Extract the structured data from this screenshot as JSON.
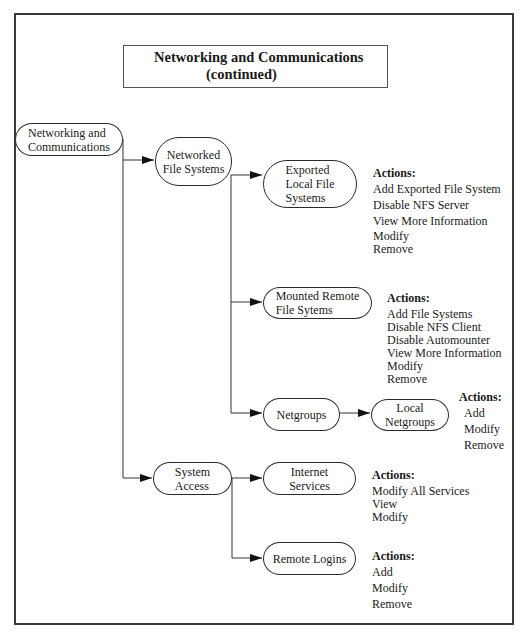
{
  "title": {
    "line1": "Networking and Communications",
    "line2": "(continued)"
  },
  "nodes": {
    "root": "Networking and\nCommunications",
    "networked_fs": "Networked\nFile Systems",
    "exported": "Exported\nLocal File\nSystems",
    "mounted": "Mounted Remote\nFile Sytems",
    "netgroups": "Netgroups",
    "local_netgroups": "Local\nNetgroups",
    "system_access": "System\nAccess",
    "internet_services": "Internet\nServices",
    "remote_logins": "Remote Logins"
  },
  "actions": {
    "exported": {
      "heading": "Actions:",
      "items": [
        "Add Exported File System",
        "Disable NFS Server",
        "View More Information",
        "Modify",
        "Remove"
      ]
    },
    "mounted": {
      "heading": "Actions:",
      "items": [
        "Add File Systems",
        "Disable NFS Client",
        "Disable Automounter",
        "View More Information",
        "Modify",
        "Remove"
      ]
    },
    "local_netgroups": {
      "heading": "Actions:",
      "items": [
        "Add",
        "Modify",
        "Remove"
      ]
    },
    "internet_services": {
      "heading": "Actions:",
      "items": [
        "Modify All Services",
        "View",
        "Modify"
      ]
    },
    "remote_logins": {
      "heading": "Actions:",
      "items": [
        "Add",
        "Modify",
        "Remove"
      ]
    }
  }
}
